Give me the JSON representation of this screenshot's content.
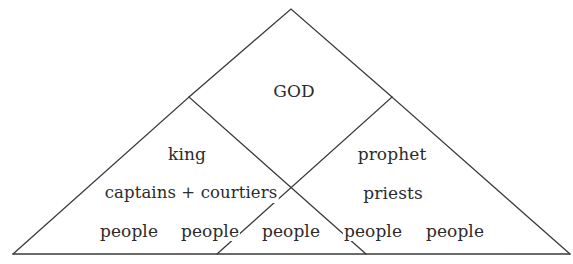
{
  "diagram": {
    "type": "overlapping-triangles",
    "line_color": "#3a3a3a",
    "text_color": "#2b2b2b",
    "background": "#ffffff",
    "shapes": {
      "outer_triangle": {
        "apex": [
          291,
          9
        ],
        "base_left": [
          13,
          254
        ],
        "base_right": [
          570,
          254
        ]
      },
      "left_triangle": {
        "apex": [
          189,
          97
        ],
        "base_left": [
          13,
          254
        ],
        "base_right": [
          366,
          254
        ]
      },
      "right_triangle": {
        "apex": [
          392,
          97
        ],
        "base_left": [
          217,
          254
        ],
        "base_right": [
          570,
          254
        ]
      }
    },
    "labels": {
      "top": "GOD",
      "left_top": "king",
      "left_middle": "captains + courtiers",
      "right_top": "prophet",
      "right_middle": "priests",
      "bottom_row": [
        "people",
        "people",
        "people",
        "people",
        "people"
      ]
    }
  }
}
